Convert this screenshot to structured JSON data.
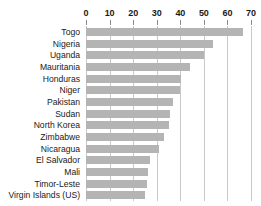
{
  "chart_data": {
    "type": "bar",
    "orientation": "horizontal",
    "title": "",
    "subtitle": "",
    "xlabel": "",
    "ylabel": "",
    "categories": [
      "Togo",
      "Nigeria",
      "Uganda",
      "Mauritania",
      "Honduras",
      "Niger",
      "Pakistan",
      "Sudan",
      "North Korea",
      "Zimbabwe",
      "Nicaragua",
      "El Salvador",
      "Mali",
      "Timor-Leste",
      "Virgin Islands (US)"
    ],
    "values": [
      66.5,
      54,
      50,
      44,
      40.5,
      40,
      37,
      35.5,
      35,
      33,
      31,
      27,
      26.5,
      26,
      25
    ],
    "xlim": [
      0,
      70
    ],
    "xticks": [
      0,
      10,
      20,
      30,
      40,
      50,
      60,
      70
    ],
    "xtick_labels": [
      "0",
      "10",
      "20",
      "30",
      "40",
      "50",
      "60",
      "70"
    ],
    "grid": true,
    "grid_axis": "x",
    "legend": null,
    "legend_position": "none",
    "bar_color": "#b4b4b4",
    "grid_color": "#c9c9c9",
    "axis_tick_color": "#8a8a8a",
    "background_color": "#ffffff",
    "text_color": "#1a1a1a"
  }
}
